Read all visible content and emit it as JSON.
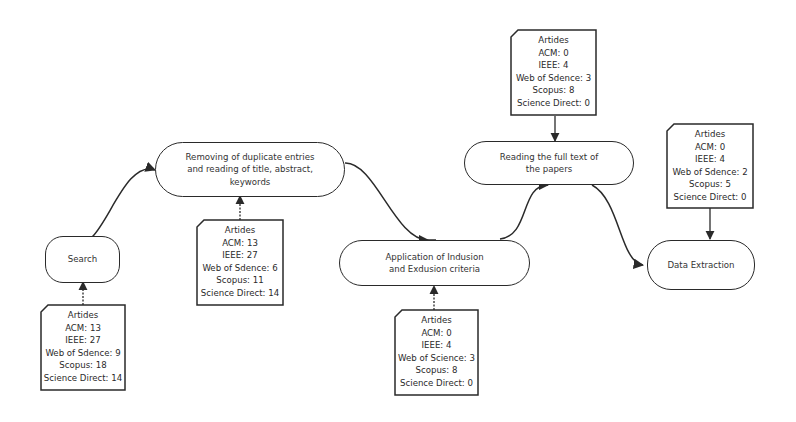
{
  "diagram": {
    "type": "flowchart",
    "processes": [
      {
        "id": "search",
        "label": "Search"
      },
      {
        "id": "dedup",
        "label": "Removing of duplicate entries and reading of title, abstract, keywords"
      },
      {
        "id": "criteria",
        "label": "Application of Indusion and Exdusion criteria"
      },
      {
        "id": "fulltext",
        "label": "Reading the full text of the papers"
      },
      {
        "id": "extraction",
        "label": "Data Extraction"
      }
    ],
    "notes": [
      {
        "id": "note_search",
        "attached_to": "search",
        "title": "Artides",
        "lines": [
          "ACM: 13",
          "IEEE: 27",
          "Web of Sdence: 9",
          "Scopus: 18",
          "Science Direct: 14"
        ]
      },
      {
        "id": "note_dedup",
        "attached_to": "dedup",
        "title": "Artides",
        "lines": [
          "ACM: 13",
          "IEEE: 27",
          "Web of Sdence: 6",
          "Scopus: 11",
          "Science Direct: 14"
        ]
      },
      {
        "id": "note_criteria",
        "attached_to": "criteria",
        "title": "Artides",
        "lines": [
          "ACM: 0",
          "IEEE: 4",
          "Web of Science: 3",
          "Scopus: 8",
          "Science Direct: 0"
        ]
      },
      {
        "id": "note_fulltext",
        "attached_to": "fulltext",
        "title": "Artides",
        "lines": [
          "ACM: 0",
          "IEEE: 4",
          "Web of Sdence: 3",
          "Scopus: 8",
          "Science Direct: 0"
        ]
      },
      {
        "id": "note_extraction",
        "attached_to": "extraction",
        "title": "Artides",
        "lines": [
          "ACM: 0",
          "IEEE: 4",
          "Web of Sdence: 2",
          "Scopus: 5",
          "Science Direct: 0"
        ]
      }
    ],
    "edges": [
      {
        "from": "search",
        "to": "dedup"
      },
      {
        "from": "dedup",
        "to": "criteria"
      },
      {
        "from": "criteria",
        "to": "fulltext"
      },
      {
        "from": "fulltext",
        "to": "extraction"
      }
    ],
    "colors": {
      "stroke": "#2a2a2a",
      "fill": "#ffffff",
      "text": "#333333"
    }
  }
}
